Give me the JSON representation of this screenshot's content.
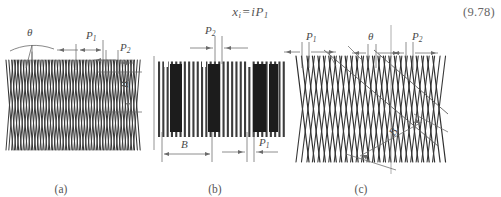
{
  "equation": {
    "text": "xᵢ = iP₁",
    "variable": "x",
    "variable_sub": "i",
    "equals": "=",
    "rhs": "iP",
    "rhs_sub": "1",
    "number": "(9.78)"
  },
  "panels": [
    {
      "id": "a",
      "caption": "(a)",
      "pattern": "zigzag-helical-low-angle",
      "labels": {
        "theta": "θ",
        "p1": "P",
        "p1_sub": "1",
        "p2": "P",
        "p2_sub": "2",
        "b": "B"
      }
    },
    {
      "id": "b",
      "caption": "(b)",
      "pattern": "vertical-stripes-with-bands",
      "labels": {
        "p1": "P",
        "p1_sub": "1",
        "p2": "P",
        "p2_sub": "2",
        "b": "B"
      }
    },
    {
      "id": "c",
      "caption": "(c)",
      "pattern": "zigzag-helical-high-angle",
      "labels": {
        "theta": "θ",
        "p1": "P",
        "p1_sub": "1",
        "p2": "P",
        "p2_sub": "2",
        "b": "B"
      }
    }
  ],
  "colors": {
    "ink": "#2b2b2b",
    "line": "#3a3a3a",
    "annotation": "#4a4a4a",
    "band": "#1e1e1e",
    "background": "#ffffff"
  }
}
